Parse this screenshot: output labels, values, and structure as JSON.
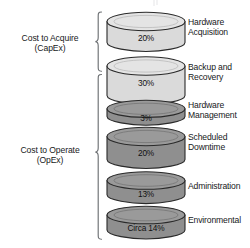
{
  "diagram": {
    "groups": [
      {
        "id": "capex",
        "label_line1": "Cost to Acquire",
        "label_line2": "(CapEx)",
        "bracket": "left-curly-brace"
      },
      {
        "id": "opex",
        "label_line1": "Cost to Operate",
        "label_line2": "(OpEx)",
        "bracket": "left-curly-brace"
      }
    ],
    "items": [
      {
        "id": "hardware-acquisition",
        "value": "20%",
        "percent": 20,
        "label_line1": "Hardware",
        "label_line2": "Acquisition",
        "shade": "light",
        "group": "capex"
      },
      {
        "id": "backup-and-recovery",
        "value": "30%",
        "percent": 30,
        "label_line1": "Backup and",
        "label_line2": "Recovery",
        "shade": "light",
        "group": "capex"
      },
      {
        "id": "hardware-management",
        "value": "3%",
        "percent": 3,
        "label_line1": "Hardware",
        "label_line2": "Management",
        "shade": "dark",
        "group": "opex"
      },
      {
        "id": "scheduled-downtime",
        "value": "20%",
        "percent": 20,
        "label_line1": "Scheduled",
        "label_line2": "Downtime",
        "shade": "dark",
        "group": "opex"
      },
      {
        "id": "administration",
        "value": "13%",
        "percent": 13,
        "label_line1": "Administration",
        "label_line2": "",
        "shade": "dark",
        "group": "opex"
      },
      {
        "id": "environmental",
        "value": "Circa 14%",
        "percent": 14,
        "label_line1": "Environmental",
        "label_line2": "",
        "shade": "dark",
        "group": "opex"
      }
    ],
    "colors": {
      "light_fill": "#dadada",
      "light_top": "#e6e6e6",
      "dark_fill": "#8f8f8f",
      "dark_top": "#9c9c9c",
      "stroke": "#2a2a2a",
      "bracket": "#6d7073",
      "background": "#ffffff"
    }
  }
}
